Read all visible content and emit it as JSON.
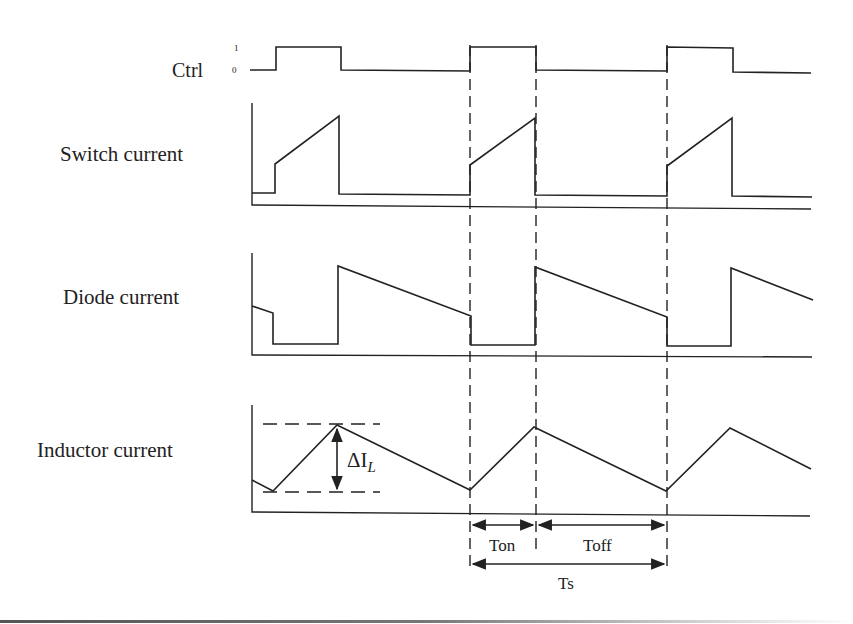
{
  "figure": {
    "type": "timing-diagram",
    "signals": [
      {
        "id": "ctrl",
        "label": "Ctrl",
        "levels": [
          "1",
          "0"
        ]
      },
      {
        "id": "switch",
        "label": "Switch current"
      },
      {
        "id": "diode",
        "label": "Diode current"
      },
      {
        "id": "inductor",
        "label": "Inductor current"
      }
    ],
    "annotations": {
      "ripple": "ΔI",
      "ripple_sub": "L",
      "ton": "Ton",
      "toff": "Toff",
      "ts": "Ts"
    },
    "page_number": "13"
  }
}
